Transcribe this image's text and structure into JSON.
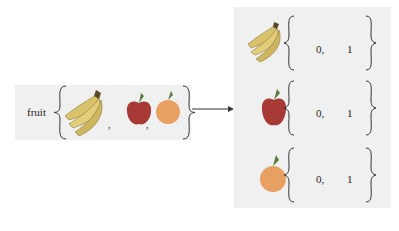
{
  "left": {
    "label": "fruit",
    "items": [
      "banana",
      "apple",
      "orange"
    ],
    "separator": ","
  },
  "right": {
    "rows": [
      {
        "icon": "banana",
        "values": [
          "0,",
          "1"
        ]
      },
      {
        "icon": "apple",
        "values": [
          "0,",
          "1"
        ]
      },
      {
        "icon": "orange",
        "values": [
          "0,",
          "1"
        ]
      }
    ]
  },
  "colors": {
    "panel": "#f0f0f0",
    "banana": "#d9c26a",
    "apple": "#a83a35",
    "orange": "#e8a062",
    "arrow": "#333333"
  }
}
